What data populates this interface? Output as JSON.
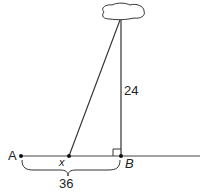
{
  "diagram": {
    "type": "geometry-word-problem",
    "labels": {
      "point_a": "A",
      "point_x": "x",
      "point_b": "B",
      "height": "24",
      "distance_ab": "36"
    },
    "elements": [
      "cloud (top object)",
      "vertical segment from cloud to B (length 24)",
      "slanted segment from cloud to x",
      "ground line through A, x, B",
      "right-angle marker at B",
      "brace under A to B labeled 36"
    ],
    "colors": {
      "stroke": "#222222",
      "background": "#ffffff"
    }
  }
}
